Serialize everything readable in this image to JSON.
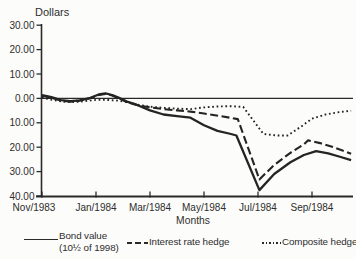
{
  "chart_data": {
    "type": "line",
    "ylabel": "Dollars",
    "xlabel": "Months",
    "grid": false,
    "zero_line": true,
    "xlim_months": [
      0,
      11.5
    ],
    "ylim": [
      -40,
      30
    ],
    "y_ticks": [
      {
        "v": 30,
        "label": "30.00"
      },
      {
        "v": 20,
        "label": "20.00"
      },
      {
        "v": 10,
        "label": "10.00"
      },
      {
        "v": 0,
        "label": "0.00"
      },
      {
        "v": -10,
        "label": "10.00"
      },
      {
        "v": -20,
        "label": "20.00"
      },
      {
        "v": -30,
        "label": "30.00"
      },
      {
        "v": -40,
        "label": "40.00"
      }
    ],
    "x_ticks": [
      {
        "m": 0,
        "label": "Nov/1983"
      },
      {
        "m": 2,
        "label": "Jan/1984"
      },
      {
        "m": 4,
        "label": "Mar/1984"
      },
      {
        "m": 6,
        "label": "May/1984"
      },
      {
        "m": 8,
        "label": "Jul/1984"
      },
      {
        "m": 10,
        "label": "Sep/1984"
      }
    ],
    "series": [
      {
        "key": "bond-value",
        "name": "Bond value (10½ of 1998)",
        "style": "solid",
        "points": [
          [
            0,
            1.3
          ],
          [
            0.35,
            0.5
          ],
          [
            0.7,
            -0.7
          ],
          [
            1.05,
            -1.1
          ],
          [
            1.4,
            -0.8
          ],
          [
            1.75,
            0.1
          ],
          [
            2.1,
            1.6
          ],
          [
            2.35,
            2.1
          ],
          [
            2.6,
            1.4
          ],
          [
            2.85,
            0.2
          ],
          [
            3.15,
            -1.3
          ],
          [
            3.5,
            -2.6
          ],
          [
            4.0,
            -4.9
          ],
          [
            4.5,
            -6.6
          ],
          [
            5.0,
            -7.3
          ],
          [
            5.5,
            -7.9
          ],
          [
            6.0,
            -11.0
          ],
          [
            6.5,
            -13.3
          ],
          [
            7.0,
            -14.6
          ],
          [
            7.2,
            -15.2
          ],
          [
            8.05,
            -37.6
          ],
          [
            8.6,
            -31.0
          ],
          [
            9.2,
            -26.2
          ],
          [
            9.7,
            -23.2
          ],
          [
            10.15,
            -21.6
          ],
          [
            10.6,
            -22.5
          ],
          [
            11.0,
            -23.8
          ],
          [
            11.45,
            -25.3
          ]
        ]
      },
      {
        "key": "interest-rate-hedge",
        "name": "Interest rate hedge",
        "style": "dashed",
        "points": [
          [
            0,
            1.1
          ],
          [
            0.35,
            0.3
          ],
          [
            0.7,
            -0.9
          ],
          [
            1.05,
            -1.3
          ],
          [
            1.4,
            -0.9
          ],
          [
            1.75,
            0.0
          ],
          [
            2.1,
            1.4
          ],
          [
            2.35,
            1.8
          ],
          [
            2.6,
            1.2
          ],
          [
            2.85,
            0.0
          ],
          [
            3.15,
            -1.5
          ],
          [
            3.5,
            -2.7
          ],
          [
            4.0,
            -3.7
          ],
          [
            4.5,
            -4.4
          ],
          [
            5.0,
            -4.9
          ],
          [
            5.5,
            -5.4
          ],
          [
            6.0,
            -6.2
          ],
          [
            6.6,
            -7.2
          ],
          [
            7.25,
            -8.5
          ],
          [
            8.05,
            -33.2
          ],
          [
            8.6,
            -27.3
          ],
          [
            9.2,
            -22.3
          ],
          [
            9.7,
            -18.8
          ],
          [
            9.85,
            -17.2
          ],
          [
            10.3,
            -18.3
          ],
          [
            10.8,
            -20.0
          ],
          [
            11.45,
            -22.7
          ]
        ]
      },
      {
        "key": "composite-hedge",
        "name": "Composite hedge",
        "style": "dotted",
        "points": [
          [
            0,
            0.4
          ],
          [
            0.4,
            -0.7
          ],
          [
            0.8,
            -1.4
          ],
          [
            1.2,
            -1.5
          ],
          [
            1.6,
            -1.1
          ],
          [
            2.0,
            -0.6
          ],
          [
            2.4,
            -0.6
          ],
          [
            2.8,
            -0.9
          ],
          [
            3.2,
            -1.7
          ],
          [
            3.6,
            -2.7
          ],
          [
            4.0,
            -3.4
          ],
          [
            4.5,
            -3.9
          ],
          [
            5.0,
            -4.2
          ],
          [
            5.5,
            -4.4
          ],
          [
            6.0,
            -3.7
          ],
          [
            6.5,
            -3.3
          ],
          [
            7.0,
            -3.2
          ],
          [
            7.45,
            -3.5
          ],
          [
            8.2,
            -14.6
          ],
          [
            8.7,
            -15.2
          ],
          [
            9.1,
            -15.2
          ],
          [
            9.6,
            -11.5
          ],
          [
            10.0,
            -8.3
          ],
          [
            10.5,
            -6.6
          ],
          [
            11.0,
            -5.6
          ],
          [
            11.45,
            -5.1
          ]
        ]
      }
    ]
  },
  "legend": {
    "items": [
      {
        "label_line1": "Bond value",
        "label_line2": "(10½ of 1998)",
        "style": "solid"
      },
      {
        "label": "Interest rate hedge",
        "style": "dashed"
      },
      {
        "label": "Composite hedge",
        "style": "dotted"
      }
    ]
  },
  "colors": {
    "line": "#242424",
    "axis": "#2a2a2a",
    "text": "#2e2e2e",
    "background": "#fcfcfa"
  }
}
